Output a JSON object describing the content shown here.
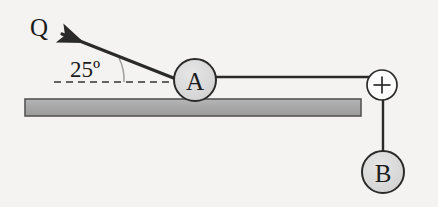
{
  "figure": {
    "background_color": "#f4f3f1"
  },
  "labels": {
    "force_label": "Q",
    "angle_label": "25º",
    "block_a_label": "A",
    "block_b_label": "B"
  },
  "colors": {
    "stroke": "#2a2a2a",
    "block_fill": "#d8d8d8",
    "table_fill": "#a9a9a9",
    "table_stroke": "#4a4a4a",
    "dash_stroke": "#333333",
    "arc_stroke": "#9a9a9a",
    "pulley_fill": "#fbfbfb"
  },
  "geometry": {
    "block_a": {
      "cx": 195,
      "cy": 80,
      "r": 21
    },
    "block_b": {
      "cx": 383,
      "cy": 172,
      "r": 21
    },
    "pulley": {
      "cx": 382,
      "cy": 85,
      "r": 15
    },
    "table": {
      "x": 25,
      "y": 99,
      "width": 336,
      "height": 17
    },
    "rope_horizontal": {
      "x1": 216,
      "y1": 77,
      "x2": 382,
      "y2": 77
    },
    "rope_vertical": {
      "x1": 383,
      "y1": 85,
      "x2": 383,
      "y2": 152
    },
    "force_arrow": {
      "x1": 176,
      "y1": 79,
      "x2": 57,
      "y2": 32
    },
    "dashed_line": {
      "x1": 54,
      "y1": 82,
      "x2": 176,
      "y2": 82
    },
    "angle_degrees": 25
  },
  "icons": {
    "arrow_head": "arrowhead-icon",
    "pulley_cross": "plus-icon"
  }
}
